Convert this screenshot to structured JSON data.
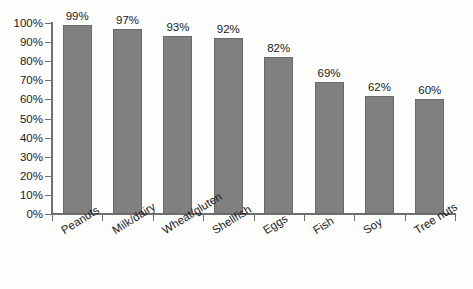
{
  "chart_data": {
    "type": "bar",
    "title": "",
    "subtitle": "",
    "xlabel": "",
    "ylabel": "",
    "categories": [
      "Peanuts",
      "Milk/dairy",
      "Wheat/gluten",
      "Shellfish",
      "Eggs",
      "Fish",
      "Soy",
      "Tree nuts"
    ],
    "values": [
      99,
      97,
      93,
      92,
      82,
      69,
      62,
      60
    ],
    "value_labels": [
      "99%",
      "97%",
      "93%",
      "92%",
      "82%",
      "69%",
      "62%",
      "60%"
    ],
    "ylim": [
      0,
      100
    ],
    "ytick_values": [
      0,
      10,
      20,
      30,
      40,
      50,
      60,
      70,
      80,
      90,
      100
    ],
    "ytick_labels": [
      "0%",
      "10%",
      "20%",
      "30%",
      "40%",
      "50%",
      "60%",
      "70%",
      "80%",
      "90%",
      "100%"
    ],
    "grid": false,
    "legend": false,
    "legend_position": "none",
    "series": [
      {
        "name": "",
        "values": [
          99,
          97,
          93,
          92,
          82,
          69,
          62,
          60
        ]
      }
    ]
  },
  "style": {
    "bar_color": "#808080",
    "bar_border_color": "#6a6a6a",
    "axis_color": "#6f6f6f",
    "text_color": "#1b1b1b",
    "background": "#fdfdfc"
  }
}
